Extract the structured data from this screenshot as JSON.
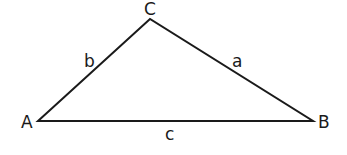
{
  "diagram": {
    "type": "triangle",
    "stroke_color": "#1a1a1a",
    "vertices": [
      {
        "label": "A",
        "x": 38,
        "y": 121
      },
      {
        "label": "B",
        "x": 313,
        "y": 121
      },
      {
        "label": "C",
        "x": 150,
        "y": 19
      }
    ],
    "sides": [
      {
        "label": "a",
        "from": "B",
        "to": "C"
      },
      {
        "label": "b",
        "from": "A",
        "to": "C"
      },
      {
        "label": "c",
        "from": "A",
        "to": "B"
      }
    ],
    "labels": {
      "vertex_a": "A",
      "vertex_b": "B",
      "vertex_c": "C",
      "side_a": "a",
      "side_b": "b",
      "side_c": "c"
    }
  }
}
